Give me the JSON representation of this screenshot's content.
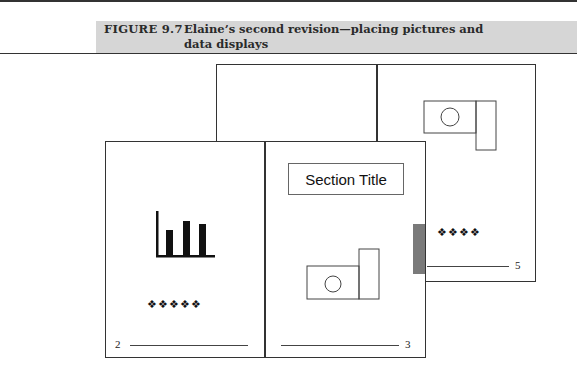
{
  "caption": {
    "label": "FIGURE 9.7",
    "text": "Elaine’s second revision—placing pictures and data displays"
  },
  "back_spread": {
    "right_page": {
      "icon": "camera-icon",
      "ornament": "❖❖❖❖",
      "page_number": "5"
    }
  },
  "front_spread": {
    "left_page": {
      "icon": "bar-chart-icon",
      "ornament": "❖❖❖❖❖",
      "page_number": "2"
    },
    "right_page": {
      "section_title": "Section Title",
      "icon": "camera-icon",
      "page_number": "3"
    }
  },
  "colors": {
    "caption_bar": "#d6d6d6",
    "tab": "#7a7a7a",
    "line": "#333333"
  }
}
